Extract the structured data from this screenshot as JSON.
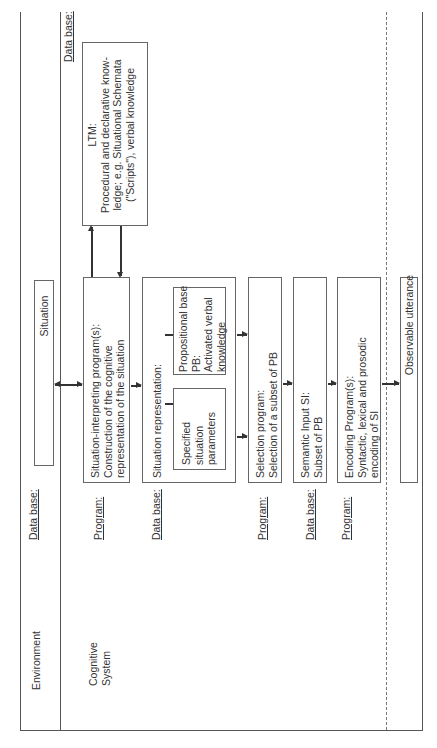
{
  "diagram": {
    "orientation": "rotated-90-ccw",
    "columns": {
      "environment": "Environment",
      "cognitive_system": [
        "Cognitive",
        "System"
      ]
    },
    "row_labels": {
      "situation_db": "Data base:",
      "ltm_db": "Data base:",
      "program1": "Program:",
      "db2": "Data base:",
      "program2": "Program:",
      "db3": "Data base:",
      "program3": "Program:"
    },
    "boxes": {
      "situation": "Situation",
      "ltm": {
        "title": "LTM:",
        "lines": [
          "Procedural and declarative know-",
          "ledge; e.g. Situational Schemata",
          "(\"Scripts\"), verbal knowledge"
        ]
      },
      "interpreting": {
        "lines": [
          "Situation-interpreting program(s):",
          "Construction of the cognitive",
          "representation of the situation"
        ]
      },
      "representation": {
        "title": "Situation representation:",
        "specified": [
          "Specified",
          "situation",
          "parameters"
        ],
        "propositional": [
          "Propositional base",
          "PB:",
          "Activated verbal",
          "knowledge"
        ]
      },
      "selection": {
        "lines": [
          "Selection program:",
          "Selection of a subset of PB"
        ]
      },
      "semantic": {
        "lines": [
          "Semantic Input SI:",
          "Subset of PB"
        ]
      },
      "encoding": {
        "lines": [
          "Encoding Program(s):",
          "Syntactic, lexical and prosodic",
          "encoding of SI"
        ]
      },
      "utterance": "Observable utterance"
    }
  }
}
